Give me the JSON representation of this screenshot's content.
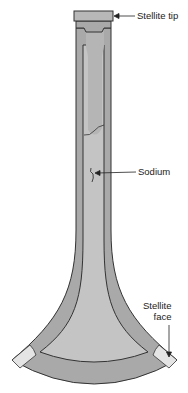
{
  "diagram": {
    "type": "cross-section",
    "labels": {
      "stellite_tip": "Stellite tip",
      "sodium": "Sodium",
      "stellite_face_line1": "Stellite",
      "stellite_face_line2": "face"
    },
    "colors": {
      "valve_body": "#a9a9a9",
      "cavity": "#c4c4c4",
      "stellite": "#e4e4e4",
      "outline": "#333333"
    }
  }
}
